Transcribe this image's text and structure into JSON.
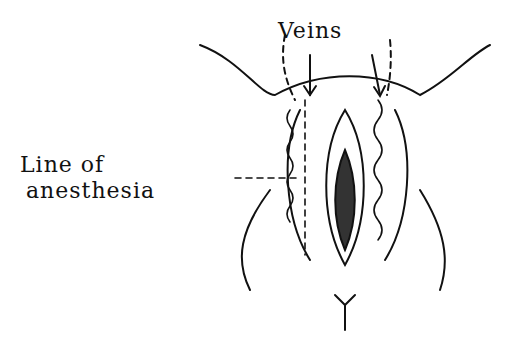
{
  "labels": {
    "veins": "Veins",
    "line_of": "Line of",
    "anesthesia": "anesthesia"
  }
}
